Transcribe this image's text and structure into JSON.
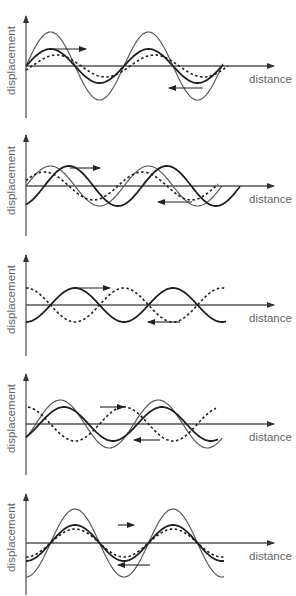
{
  "figure": {
    "axis_labels": {
      "y": "displacement",
      "x": "distance"
    },
    "colors": {
      "axis": "#555555",
      "resultant": "#5a5a5a",
      "wave_solid": "#1e1e1e",
      "wave_dashed": "#1e1e1e",
      "label": "#666666",
      "background": "#ffffff"
    },
    "panels": [
      {
        "id": 1,
        "top": 0,
        "axis_y": 66,
        "axis_top": 12,
        "axis_bottom": 118,
        "waves": [
          {
            "style": "thin",
            "amp": 34,
            "phase": 0,
            "x0": 26,
            "x1": 223
          },
          {
            "style": "thick",
            "amp": 17,
            "phase": 0,
            "x0": 26,
            "x1": 223
          },
          {
            "style": "dashed",
            "amp": 11,
            "phase": -0.25,
            "x0": 26,
            "x1": 228
          }
        ],
        "arrows": [
          {
            "dir": "right",
            "x0": 52,
            "x1": 86,
            "y": 49
          },
          {
            "dir": "left",
            "x0": 203,
            "x1": 169,
            "y": 88
          }
        ]
      },
      {
        "id": 2,
        "top": 0,
        "axis_y": 186,
        "axis_top": 131,
        "axis_bottom": 236,
        "waves": [
          {
            "style": "thin",
            "amp": 20,
            "phase": 0,
            "x0": 26,
            "x1": 222
          },
          {
            "style": "thick",
            "amp": 20,
            "phase": -0.75,
            "x0": 26,
            "x1": 240
          },
          {
            "style": "dashed",
            "amp": 14,
            "phase": 0.25,
            "x0": 26,
            "x1": 218
          }
        ],
        "arrows": [
          {
            "dir": "right",
            "x0": 70,
            "x1": 100,
            "y": 168
          },
          {
            "dir": "left",
            "x0": 192,
            "x1": 158,
            "y": 202
          }
        ]
      },
      {
        "id": 3,
        "top": 0,
        "axis_y": 305,
        "axis_top": 251,
        "axis_bottom": 356,
        "waves": [
          {
            "style": "thick",
            "amp": 17,
            "phase": -1.0,
            "x0": 26,
            "x1": 226
          },
          {
            "style": "dashed",
            "amp": 17,
            "phase": 1.0,
            "x0": 26,
            "x1": 226
          }
        ],
        "arrows": [
          {
            "dir": "right",
            "x0": 76,
            "x1": 110,
            "y": 288
          },
          {
            "dir": "left",
            "x0": 180,
            "x1": 148,
            "y": 322
          }
        ]
      },
      {
        "id": 4,
        "top": 0,
        "axis_y": 424,
        "axis_top": 370,
        "axis_bottom": 475,
        "waves": [
          {
            "style": "thin",
            "amp": 24,
            "phase": -0.4,
            "x0": 26,
            "x1": 222
          },
          {
            "style": "thick",
            "amp": 17,
            "phase": -0.55,
            "x0": 26,
            "x1": 218
          },
          {
            "style": "dashed",
            "amp": 17,
            "phase": 1.0,
            "x0": 28,
            "x1": 216
          }
        ],
        "arrows": [
          {
            "dir": "right",
            "x0": 100,
            "x1": 124,
            "y": 407
          },
          {
            "dir": "left",
            "x0": 160,
            "x1": 134,
            "y": 440
          }
        ]
      },
      {
        "id": 5,
        "top": 0,
        "axis_y": 543,
        "axis_top": 490,
        "axis_bottom": 595,
        "waves": [
          {
            "style": "thin",
            "amp": 34,
            "phase": -1.0,
            "x0": 26,
            "x1": 224
          },
          {
            "style": "thick",
            "amp": 18,
            "phase": -1.0,
            "x0": 26,
            "x1": 224
          },
          {
            "style": "dashed",
            "amp": 14,
            "phase": -1.0,
            "x0": 26,
            "x1": 226
          }
        ],
        "arrows": [
          {
            "dir": "right",
            "x0": 118,
            "x1": 134,
            "y": 525
          },
          {
            "dir": "left",
            "x0": 150,
            "x1": 118,
            "y": 565
          }
        ]
      }
    ],
    "wavelength": 98,
    "axis_x_end": 274,
    "axis_x_start": 26
  }
}
